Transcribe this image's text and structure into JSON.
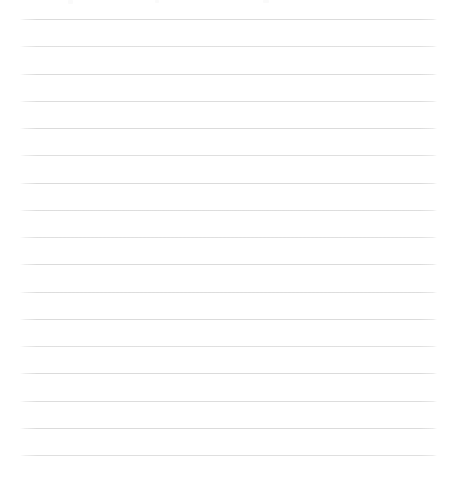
{
  "page": {
    "kind": "lined-paper-scan",
    "width": 454,
    "height": 477,
    "background_color": "#ffffff",
    "has_text": false,
    "has_ui_chrome": false
  },
  "rules": {
    "count": 17,
    "color": "#dedede",
    "thickness_px": 1,
    "x_start": 20,
    "x_end": 437,
    "first_y": 19,
    "spacing_px": 27.25,
    "y_positions": [
      19,
      46.25,
      73.5,
      100.75,
      128,
      155.25,
      182.5,
      209.75,
      237,
      264.25,
      291.5,
      318.75,
      346,
      373.25,
      400.5,
      427.75,
      455
    ],
    "tones": [
      "tone-a",
      "tone-b",
      "tone-a",
      "tone-c",
      "tone-a",
      "tone-b",
      "tone-a",
      "tone-c",
      "tone-b",
      "tone-a",
      "tone-c",
      "tone-a",
      "tone-b",
      "tone-a",
      "tone-c",
      "tone-a",
      "tone-b"
    ]
  },
  "top_artifacts": {
    "color": "#fafafa",
    "marks": [
      {
        "x": 68,
        "width": 5,
        "height": 4
      },
      {
        "x": 155,
        "width": 4,
        "height": 3
      },
      {
        "x": 263,
        "width": 6,
        "height": 3
      }
    ]
  }
}
